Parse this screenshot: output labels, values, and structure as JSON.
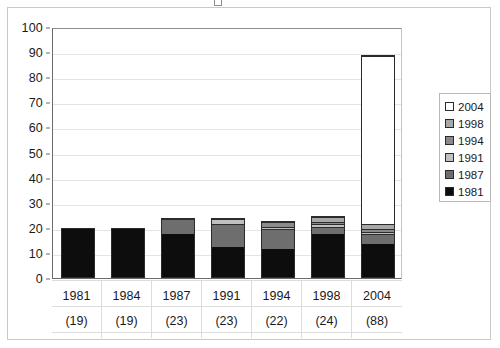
{
  "chart_data": {
    "type": "bar",
    "subtype": "stacked-column",
    "title": "",
    "xlabel": "",
    "ylabel": "",
    "ylim": [
      0,
      100
    ],
    "ytick_step": 10,
    "yticks": [
      0,
      10,
      20,
      30,
      40,
      50,
      60,
      70,
      80,
      90,
      100
    ],
    "grid": true,
    "legend_position": "right",
    "categories": [
      "1981",
      "1984",
      "1987",
      "1991",
      "1994",
      "1998",
      "2004"
    ],
    "category_totals": [
      "(19)",
      "(19)",
      "(23)",
      "(23)",
      "(22)",
      "(24)",
      "(88)"
    ],
    "totals": [
      19,
      19,
      23,
      23,
      22,
      24,
      88
    ],
    "series": [
      {
        "name": "1981",
        "color": "#0d0d0d",
        "values": [
          19,
          19,
          17,
          12,
          11,
          17,
          13
        ]
      },
      {
        "name": "1987",
        "color": "#6e6e6e",
        "values": [
          0,
          0,
          6,
          9,
          8,
          3,
          4
        ]
      },
      {
        "name": "1991",
        "color": "#c0c0c0",
        "values": [
          0,
          0,
          0,
          2,
          1,
          1,
          1
        ]
      },
      {
        "name": "1994",
        "color": "#8a8a8a",
        "values": [
          0,
          0,
          0,
          0,
          2,
          1,
          1
        ]
      },
      {
        "name": "1998",
        "color": "#a8a8a8",
        "values": [
          0,
          0,
          0,
          0,
          0,
          2,
          2
        ]
      },
      {
        "name": "2004",
        "color": "#ffffff",
        "values": [
          0,
          0,
          0,
          0,
          0,
          0,
          67
        ]
      }
    ],
    "legend_entries": [
      {
        "label": "2004",
        "color": "#ffffff"
      },
      {
        "label": "1998",
        "color": "#a8a8a8"
      },
      {
        "label": "1994",
        "color": "#8a8a8a"
      },
      {
        "label": "1991",
        "color": "#c0c0c0"
      },
      {
        "label": "1987",
        "color": "#6e6e6e"
      },
      {
        "label": "1981",
        "color": "#0d0d0d"
      }
    ]
  }
}
